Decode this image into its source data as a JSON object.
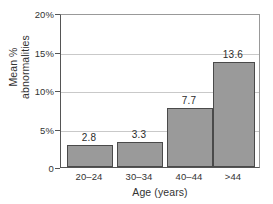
{
  "chart_data": {
    "type": "bar",
    "title": "",
    "xlabel": "Age (years)",
    "ylabel_lines": [
      "Mean %",
      "abnormalities"
    ],
    "ylabel": "Mean % abnormalities",
    "categories": [
      "20–24",
      "30–34",
      "40–44",
      ">44"
    ],
    "values": [
      2.8,
      3.3,
      7.7,
      13.6
    ],
    "value_labels": [
      "2.8",
      "3.3",
      "7.7",
      "13.6"
    ],
    "ylim": [
      0,
      20
    ],
    "yticks": [
      0,
      5,
      10,
      15,
      20
    ],
    "ytick_labels": [
      "0",
      "5%",
      "10%",
      "15%",
      "20%"
    ],
    "grid": "horizontal",
    "legend": "none",
    "bar_color": "#9a9a9a",
    "bar_edge_color": "#4a4a4a",
    "axis_color": "#555555",
    "grid_color": "#c9c9c9",
    "background_color": "#ffffff"
  }
}
